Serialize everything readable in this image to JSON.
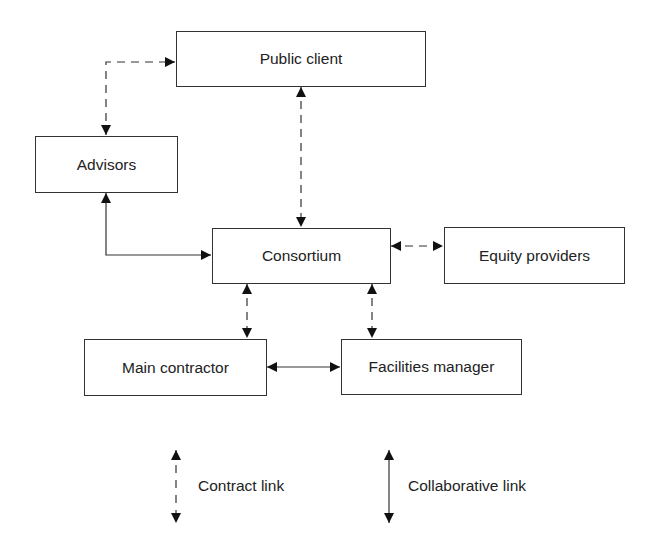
{
  "diagram": {
    "nodes": [
      {
        "id": "public_client",
        "label": "Public client"
      },
      {
        "id": "advisors",
        "label": "Advisors"
      },
      {
        "id": "consortium",
        "label": "Consortium"
      },
      {
        "id": "equity_providers",
        "label": "Equity providers"
      },
      {
        "id": "main_contractor",
        "label": "Main contractor"
      },
      {
        "id": "facilities_manager",
        "label": "Facilities manager"
      }
    ],
    "edges": [
      {
        "from": "advisors",
        "to": "public_client",
        "type": "contract",
        "bidirectional": true
      },
      {
        "from": "public_client",
        "to": "consortium",
        "type": "contract",
        "bidirectional": true
      },
      {
        "from": "advisors",
        "to": "consortium",
        "type": "collaborative",
        "bidirectional": true
      },
      {
        "from": "consortium",
        "to": "equity_providers",
        "type": "contract",
        "bidirectional": true
      },
      {
        "from": "consortium",
        "to": "main_contractor",
        "type": "contract",
        "bidirectional": true
      },
      {
        "from": "consortium",
        "to": "facilities_manager",
        "type": "contract",
        "bidirectional": true
      },
      {
        "from": "main_contractor",
        "to": "facilities_manager",
        "type": "collaborative",
        "bidirectional": true
      }
    ],
    "legend": {
      "contract": "Contract link",
      "collaborative": "Collaborative link"
    }
  }
}
